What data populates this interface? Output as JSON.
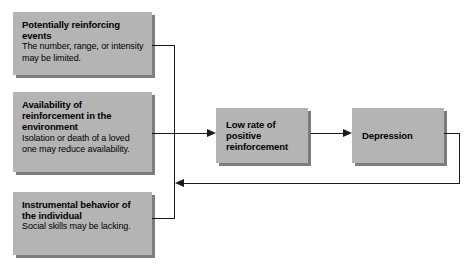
{
  "diagram": {
    "type": "flowchart",
    "background_color": "#ffffff",
    "box_fill_color": "#b4b4b4",
    "box_shadow_color": "#7d7d7d",
    "line_color": "#1a1a1a",
    "causes": [
      {
        "id": "events",
        "title": "Potentially reinforcing events",
        "description": "The number, range, or intensity may be limited."
      },
      {
        "id": "availability",
        "title": "Availability of reinforcement  in the environment",
        "description": "Isolation or death of a loved one may reduce availability."
      },
      {
        "id": "behavior",
        "title": "Instrumental behavior of the individual",
        "description": "Social skills may be lacking."
      }
    ],
    "effects": [
      {
        "id": "lowrate",
        "title": "Low rate of positive reinforcement"
      },
      {
        "id": "depression",
        "title": "Depression"
      }
    ],
    "connectors": [
      {
        "id": "causes-to-lowrate",
        "from": "causes-bus",
        "to": "lowrate",
        "direction": "right"
      },
      {
        "id": "lowrate-to-depression",
        "from": "lowrate",
        "to": "depression",
        "direction": "right"
      },
      {
        "id": "depression-feedback",
        "from": "depression",
        "to": "causes-bus",
        "direction": "left"
      }
    ]
  }
}
